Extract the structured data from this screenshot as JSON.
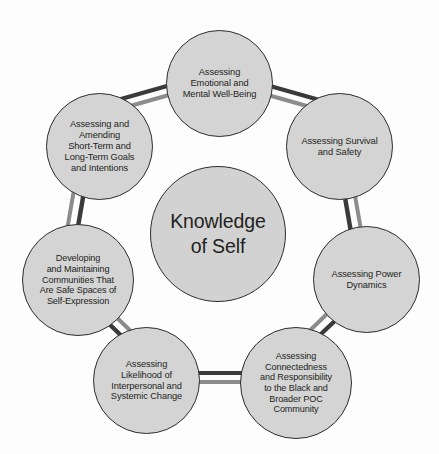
{
  "diagram": {
    "type": "cycle",
    "colors": {
      "circle_fill": "#d4d4d4",
      "circle_border": "#2d2d2d",
      "connector_dark": "#3a3a3a",
      "connector_light": "#8c8c8c",
      "background": "#fdfdfd",
      "text": "#231f20"
    },
    "center": {
      "label": "Knowledge\nof Self"
    },
    "nodes": [
      {
        "id": "emotional-wellbeing",
        "label": "Assessing\nEmotional and\nMental Well-Being"
      },
      {
        "id": "survival-safety",
        "label": "Assessing Survival\nand Safety"
      },
      {
        "id": "power-dynamics",
        "label": "Assessing Power\nDynamics"
      },
      {
        "id": "connectedness-responsibility",
        "label": "Assessing\nConnectedness\nand Responsibility\nto the Black and\nBroader POC\nCommunity"
      },
      {
        "id": "likelihood-change",
        "label": "Assessing\nLikelihood of\nInterpersonal and\nSystemic Change"
      },
      {
        "id": "safe-spaces",
        "label": "Developing\nand Maintaining\nCommunities That\nAre Safe Spaces of\nSelf-Expression"
      },
      {
        "id": "goals-intentions",
        "label": "Assessing and\nAmending\nShort-Term and\nLong-Term Goals\nand Intentions"
      }
    ]
  }
}
